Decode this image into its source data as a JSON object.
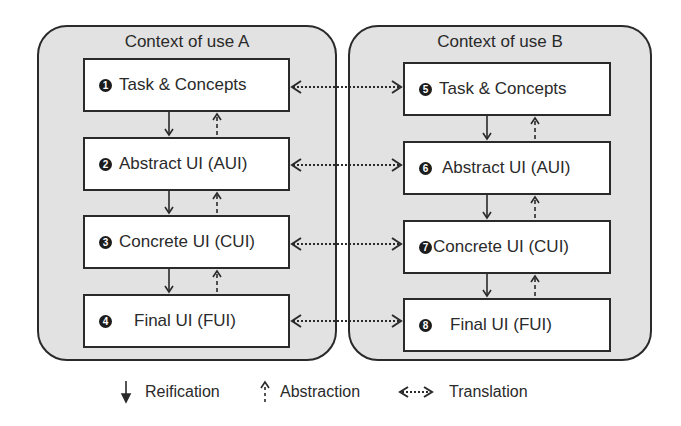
{
  "diagram": {
    "contexts": [
      {
        "title": "Context of use A",
        "boxes": [
          {
            "num": "1",
            "label": "Task & Concepts"
          },
          {
            "num": "2",
            "label": "Abstract UI (AUI)"
          },
          {
            "num": "3",
            "label": "Concrete UI (CUI)"
          },
          {
            "num": "4",
            "label": "Final UI (FUI)"
          }
        ]
      },
      {
        "title": "Context of use B",
        "boxes": [
          {
            "num": "5",
            "label": "Task & Concepts"
          },
          {
            "num": "6",
            "label": "Abstract UI (AUI)"
          },
          {
            "num": "7",
            "label": "Concrete UI (CUI)"
          },
          {
            "num": "8",
            "label": "Final UI (FUI)"
          }
        ]
      }
    ],
    "arrows": {
      "reification": "solid-down-arrow",
      "abstraction": "dashed-up-arrow",
      "translation": "dotted-bidirectional-arrow"
    },
    "legend": [
      {
        "icon": "solid-down-arrow-icon",
        "label": "Reification"
      },
      {
        "icon": "dashed-up-arrow-icon",
        "label": "Abstraction"
      },
      {
        "icon": "dotted-double-arrow-icon",
        "label": "Translation"
      }
    ],
    "colors": {
      "container_fill": "#e2e2e2",
      "box_fill": "#ffffff",
      "stroke": "#2a2a2a"
    }
  }
}
